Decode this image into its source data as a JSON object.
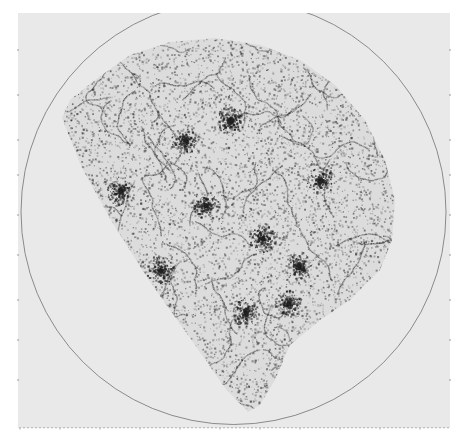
{
  "figure": {
    "background": "#ffffff",
    "panel": {
      "x": 18,
      "y": 13,
      "width": 432,
      "height": 415,
      "color": "#e9e9e9"
    },
    "circle": {
      "cx": 233.5,
      "cy": 212,
      "r": 212.5,
      "stroke": "#8a8a8a",
      "stroke_width": 1
    },
    "survey_region": {
      "polygon": [
        [
          62,
          118
        ],
        [
          70,
          100
        ],
        [
          95,
          80
        ],
        [
          130,
          55
        ],
        [
          170,
          42
        ],
        [
          215,
          38
        ],
        [
          260,
          45
        ],
        [
          300,
          60
        ],
        [
          335,
          85
        ],
        [
          365,
          120
        ],
        [
          385,
          160
        ],
        [
          395,
          200
        ],
        [
          392,
          240
        ],
        [
          380,
          270
        ],
        [
          350,
          300
        ],
        [
          320,
          320
        ],
        [
          290,
          345
        ],
        [
          275,
          380
        ],
        [
          260,
          405
        ],
        [
          248,
          412
        ],
        [
          225,
          388
        ],
        [
          190,
          338
        ],
        [
          150,
          282
        ],
        [
          112,
          222
        ],
        [
          82,
          168
        ]
      ],
      "dense_clumps": [
        [
          245,
          312
        ],
        [
          288,
          303
        ],
        [
          262,
          238
        ],
        [
          185,
          140
        ],
        [
          205,
          205
        ],
        [
          298,
          265
        ],
        [
          160,
          270
        ],
        [
          320,
          180
        ],
        [
          230,
          120
        ],
        [
          120,
          190
        ]
      ],
      "speckle_color": "#222222",
      "seed": 7
    },
    "tick_row": {
      "y": 427,
      "x_start": 20,
      "x_end": 448,
      "minor_spacing": 4,
      "major_every": 10,
      "color": "#777777"
    },
    "left_ticks": {
      "x": 18,
      "ys": [
        50,
        95,
        140,
        175,
        215,
        255,
        300,
        340,
        380
      ]
    },
    "right_ticks": {
      "x": 450,
      "ys": [
        50,
        95,
        140,
        175,
        215,
        255,
        300,
        340,
        380
      ]
    }
  }
}
